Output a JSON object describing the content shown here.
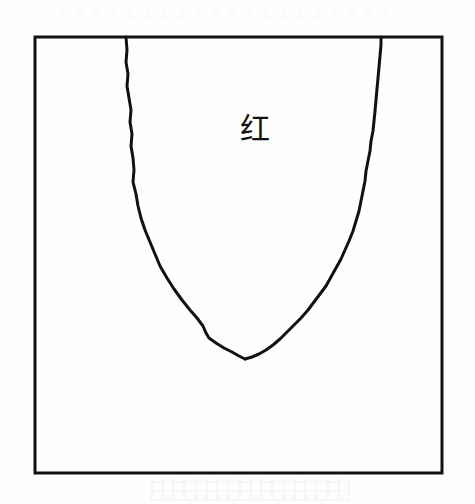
{
  "figure": {
    "title": "",
    "background_color": "#fefefe",
    "ink_color": "#111111",
    "frame": {
      "name": "rectangular-border",
      "x": 35,
      "y": 37,
      "width": 407,
      "height": 436,
      "stroke_width": 3,
      "stroke_color": "#111111",
      "fill": "none"
    },
    "labels": [
      {
        "id": "inner-region-label",
        "text": "红",
        "meaning": "red",
        "x": 255,
        "y": 129,
        "font_size": 30,
        "color": "#111111"
      }
    ]
  },
  "chart_data": {
    "type": "line",
    "title": "",
    "subtitle": "",
    "xlabel": "",
    "ylabel": "",
    "xlim": [
      35,
      442
    ],
    "ylim": [
      473,
      37
    ],
    "grid": false,
    "legend": false,
    "legend_position": "none",
    "annotations": [
      {
        "text": "红",
        "x": 255,
        "y": 129,
        "description": "label placed inside the region bounded by the U-shaped curve"
      }
    ],
    "series": [
      {
        "name": "boundary-curve-left-branch",
        "stroke": "#111111",
        "stroke_width": 3,
        "points": [
          [
            126,
            37
          ],
          [
            127,
            50
          ],
          [
            126,
            62
          ],
          [
            128,
            74
          ],
          [
            127,
            86
          ],
          [
            129,
            98
          ],
          [
            131,
            110
          ],
          [
            130,
            122
          ],
          [
            132,
            134
          ],
          [
            131,
            146
          ],
          [
            133,
            158
          ],
          [
            134,
            170
          ],
          [
            133,
            182
          ],
          [
            136,
            194
          ],
          [
            138,
            206
          ],
          [
            141,
            218
          ],
          [
            145,
            230
          ],
          [
            150,
            242
          ],
          [
            155,
            254
          ],
          [
            160,
            266
          ],
          [
            167,
            278
          ],
          [
            174,
            289
          ],
          [
            182,
            300
          ],
          [
            190,
            310
          ],
          [
            197,
            318
          ],
          [
            203,
            326
          ],
          [
            206,
            333
          ],
          [
            209,
            338
          ],
          [
            216,
            343
          ],
          [
            224,
            348
          ],
          [
            232,
            352
          ],
          [
            239,
            356
          ],
          [
            245,
            359
          ]
        ]
      },
      {
        "name": "boundary-curve-right-branch",
        "stroke": "#111111",
        "stroke_width": 3,
        "points": [
          [
            245,
            359
          ],
          [
            252,
            357
          ],
          [
            259,
            354
          ],
          [
            266,
            350
          ],
          [
            273,
            345
          ],
          [
            280,
            339
          ],
          [
            287,
            332
          ],
          [
            294,
            325
          ],
          [
            301,
            318
          ],
          [
            308,
            310
          ],
          [
            314,
            302
          ],
          [
            320,
            294
          ],
          [
            326,
            286
          ],
          [
            331,
            277
          ],
          [
            336,
            268
          ],
          [
            341,
            259
          ],
          [
            345,
            250
          ],
          [
            349,
            241
          ],
          [
            353,
            231
          ],
          [
            356,
            221
          ],
          [
            359,
            211
          ],
          [
            361,
            201
          ],
          [
            363,
            191
          ],
          [
            365,
            181
          ],
          [
            366,
            171
          ],
          [
            368,
            161
          ],
          [
            370,
            151
          ],
          [
            371,
            141
          ],
          [
            373,
            131
          ],
          [
            374,
            121
          ],
          [
            375,
            111
          ],
          [
            376,
            100
          ],
          [
            377,
            89
          ],
          [
            378,
            78
          ],
          [
            379,
            67
          ],
          [
            380,
            56
          ],
          [
            381,
            45
          ],
          [
            381,
            37
          ]
        ]
      }
    ]
  }
}
